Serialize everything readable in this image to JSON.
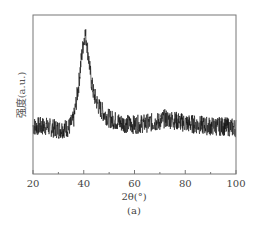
{
  "chart_data": {
    "type": "line",
    "title": "",
    "xlabel": "2θ(°)",
    "ylabel": "强度(a.u.)",
    "caption": "(a)",
    "xlim": [
      20,
      100
    ],
    "ylim": [
      0,
      1
    ],
    "xticks": [
      20,
      40,
      60,
      80,
      100
    ],
    "xticks_minor": [
      30,
      50,
      70,
      90
    ],
    "yticks": [],
    "grid": false,
    "legend": null,
    "series": [
      {
        "name": "XRD pattern",
        "color": "#111111",
        "noise": 0.06,
        "x": [
          20,
          25,
          30,
          34,
          36,
          38,
          39,
          40,
          40.5,
          41,
          42,
          43,
          44,
          46,
          48,
          50,
          55,
          60,
          65,
          70,
          72,
          75,
          80,
          85,
          90,
          95,
          100
        ],
        "y": [
          0.3,
          0.3,
          0.28,
          0.29,
          0.34,
          0.56,
          0.72,
          0.84,
          0.88,
          0.85,
          0.72,
          0.58,
          0.5,
          0.42,
          0.38,
          0.35,
          0.32,
          0.31,
          0.32,
          0.33,
          0.35,
          0.34,
          0.32,
          0.31,
          0.3,
          0.3,
          0.29
        ]
      }
    ]
  }
}
